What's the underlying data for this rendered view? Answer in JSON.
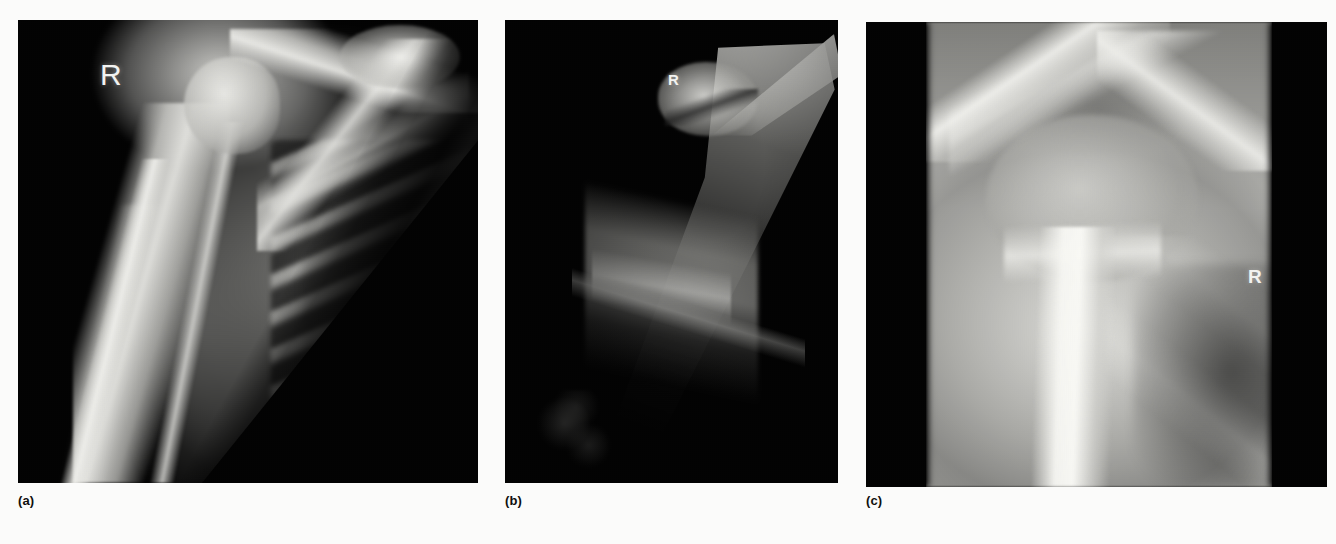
{
  "figure": {
    "background_color": "#fbfbfa",
    "modality": "radiograph",
    "panel_count": 3
  },
  "panels": [
    {
      "caption": "(a)",
      "side_marker": "R",
      "marker_size_px": 30,
      "region": "right shoulder and proximal humerus, anteroposterior view",
      "background_color": "#000000",
      "notes": "diagonal collimation edge from upper right to lower centre; ribcage with dark intercostal spaces at right"
    },
    {
      "caption": "(b)",
      "side_marker": "R",
      "marker_size_px": 15,
      "region": "right humerus, underexposed oblique view",
      "background_color": "#000000",
      "notes": "narrow bright collimated wedge at upper right tapering to lower left"
    },
    {
      "caption": "(c)",
      "side_marker": "R",
      "marker_size_px": 19,
      "region": "right shoulder, coned-down magnified view",
      "background_color": "#000000",
      "notes": "bright central exposed strip flanked by black collimation borders"
    }
  ]
}
